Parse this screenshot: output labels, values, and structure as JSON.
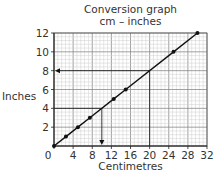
{
  "chart_data": {
    "type": "line",
    "title": "Conversion graph",
    "subtitle": "cm – inches",
    "xlabel": "Centimetres",
    "ylabel": "Inches",
    "xlim": [
      0,
      32
    ],
    "ylim": [
      0,
      12
    ],
    "x_ticks": [
      0,
      4,
      8,
      12,
      16,
      20,
      24,
      28,
      32
    ],
    "y_ticks": [
      0,
      2,
      4,
      6,
      8,
      10,
      12
    ],
    "grid": true,
    "legend": null,
    "series": [
      {
        "name": "cm to inches",
        "x": [
          0,
          2.5,
          5,
          7.5,
          12.5,
          15,
          25,
          30
        ],
        "y": [
          0,
          1,
          2,
          3,
          5,
          6,
          10,
          12
        ],
        "markers": true
      }
    ],
    "annotations": [
      {
        "type": "reading",
        "from_x": 20,
        "to_y": 8,
        "description": "Vertical line up from 20 cm to graph, horizontal arrow left to 8 inches"
      },
      {
        "type": "reading",
        "from_y": 4,
        "to_x": 10,
        "description": "Horizontal line from 4 inches to graph, vertical arrow down to 10 cm"
      }
    ]
  },
  "labels": {
    "title": "Conversion graph",
    "subtitle": "cm – inches",
    "xlabel": "Centimetres",
    "ylabel": "Inches",
    "x_ticks": [
      "0",
      "4",
      "8",
      "12",
      "16",
      "20",
      "24",
      "28",
      "32"
    ],
    "y_ticks": [
      "2",
      "4",
      "6",
      "8",
      "10",
      "12"
    ]
  }
}
